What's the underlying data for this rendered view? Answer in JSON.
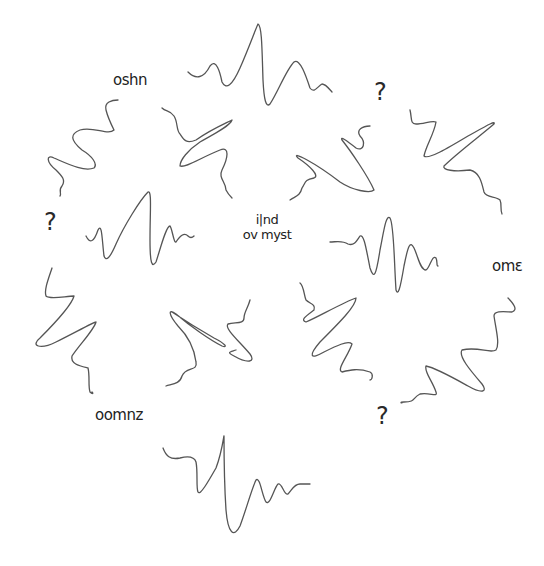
{
  "diagram": {
    "style": "hand-drawn sketch",
    "stroke_color": "#555555",
    "text_color": "#222222",
    "background": "#ffffff",
    "labels": {
      "top_left": "oshn",
      "center_line1": "i|nd",
      "center_line2": "ov myst",
      "right": "omε",
      "bottom_left": "oomnz"
    },
    "question_marks": {
      "top_right": "?",
      "left": "?",
      "bottom_right": "?"
    },
    "wave_count": 9
  }
}
